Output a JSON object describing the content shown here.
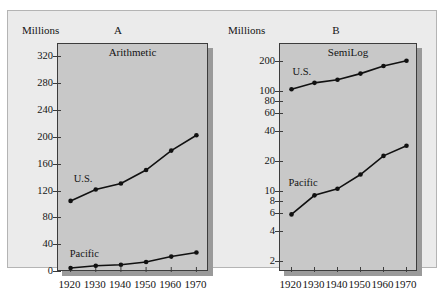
{
  "figure": {
    "background": "#ffffff",
    "frame_background": "#ebebeb",
    "plot_background": "#c8c8c8",
    "line_color": "#111111"
  },
  "panels": [
    {
      "letter": "A",
      "axis_caption": "Millions",
      "title": "Arithmetic",
      "scale": "linear"
    },
    {
      "letter": "B",
      "axis_caption": "Millions",
      "title": "SemiLog",
      "scale": "log"
    }
  ],
  "series_labels": {
    "us": "U.S.",
    "pacific": "Pacific"
  },
  "x_tick_labels": [
    "1920",
    "1930",
    "1940",
    "1950",
    "1960",
    "1970"
  ],
  "panel_a_y_ticks": [
    "0",
    "40",
    "80",
    "120",
    "160",
    "200",
    "240",
    "280",
    "320"
  ],
  "panel_b_y_ticks": [
    "2",
    "4",
    "6",
    "8",
    "10",
    "20",
    "40",
    "60",
    "80",
    "100",
    "200"
  ],
  "chart_data": [
    {
      "type": "line",
      "title": "Arithmetic",
      "panel": "A",
      "xlabel": "",
      "ylabel": "Millions",
      "x": [
        1920,
        1930,
        1940,
        1950,
        1960,
        1970
      ],
      "xlim": [
        1915,
        1975
      ],
      "ylim": [
        0,
        340
      ],
      "yscale": "linear",
      "yticks": [
        0,
        40,
        80,
        120,
        160,
        200,
        240,
        280,
        320
      ],
      "grid": false,
      "legend": "inline-labels",
      "series": [
        {
          "name": "U.S.",
          "values": [
            106,
            123,
            132,
            152,
            181,
            204
          ]
        },
        {
          "name": "Pacific",
          "values": [
            6,
            9.3,
            10.8,
            15,
            23,
            29
          ]
        }
      ]
    },
    {
      "type": "line",
      "title": "SemiLog",
      "panel": "B",
      "xlabel": "",
      "ylabel": "Millions",
      "x": [
        1920,
        1930,
        1940,
        1950,
        1960,
        1970
      ],
      "xlim": [
        1915,
        1975
      ],
      "ylim": [
        1.6,
        300
      ],
      "yscale": "log",
      "yticks": [
        2,
        4,
        6,
        8,
        10,
        20,
        40,
        60,
        80,
        100,
        200
      ],
      "grid": false,
      "legend": "inline-labels",
      "series": [
        {
          "name": "U.S.",
          "values": [
            106,
            123,
            132,
            152,
            181,
            204
          ]
        },
        {
          "name": "Pacific",
          "values": [
            6,
            9.3,
            10.8,
            15,
            23,
            29
          ]
        }
      ]
    }
  ]
}
